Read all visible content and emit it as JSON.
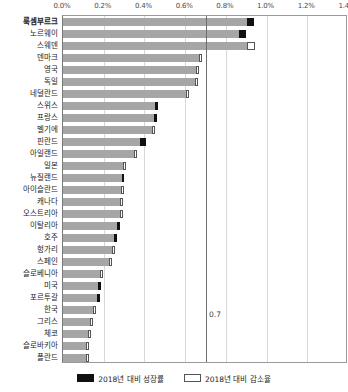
{
  "chart_data": {
    "type": "bar",
    "orientation": "horizontal",
    "title": "",
    "xlabel": "",
    "ylabel": "",
    "xlim": [
      0.0,
      1.4
    ],
    "xticks": [
      "0.0%",
      "0.2%",
      "0.4%",
      "0.6%",
      "0.8%",
      "1.0%",
      "1.2%",
      "1.4%"
    ],
    "xtick_values": [
      0.0,
      0.2,
      0.4,
      0.6,
      0.8,
      1.0,
      1.2,
      1.4
    ],
    "grid": true,
    "legend_position": "bottom",
    "annotations": [
      {
        "label": "0.7",
        "x": 0.7,
        "type": "reference-line"
      }
    ],
    "categories": [
      "룩셈부르크",
      "노르웨이",
      "스웨덴",
      "덴마크",
      "영국",
      "독일",
      "네덜란드",
      "스위스",
      "프랑스",
      "벨기에",
      "핀란드",
      "아일랜드",
      "일본",
      "뉴질랜드",
      "아이슬란드",
      "캐나다",
      "오스트리아",
      "이탈리아",
      "호주",
      "헝가리",
      "스페인",
      "슬로베니아",
      "미국",
      "포르투갈",
      "한국",
      "그리스",
      "체코",
      "슬로바키아",
      "폴란드"
    ],
    "series": [
      {
        "name": "2018년 대비 성장률",
        "color": "#111111",
        "key": "up"
      },
      {
        "name": "2018년 대비 감소율",
        "color": "#ffffff",
        "key": "down"
      }
    ],
    "base_color": "#a6a6a6",
    "values": [
      {
        "category": "룩셈부르크",
        "base": 0.905,
        "cap": 0.035,
        "cap_type": "up",
        "total": 0.94
      },
      {
        "category": "노르웨이",
        "base": 0.865,
        "cap": 0.035,
        "cap_type": "up",
        "total": 0.9
      },
      {
        "category": "스웨덴",
        "base": 0.905,
        "cap": 0.04,
        "cap_type": "down",
        "total": 0.945
      },
      {
        "category": "덴마크",
        "base": 0.675,
        "cap": 0.01,
        "cap_type": "down",
        "total": 0.685
      },
      {
        "category": "영국",
        "base": 0.66,
        "cap": 0.01,
        "cap_type": "down",
        "total": 0.67
      },
      {
        "category": "독일",
        "base": 0.655,
        "cap": 0.01,
        "cap_type": "down",
        "total": 0.665
      },
      {
        "category": "네덜란드",
        "base": 0.61,
        "cap": 0.01,
        "cap_type": "down",
        "total": 0.62
      },
      {
        "category": "스위스",
        "base": 0.455,
        "cap": 0.012,
        "cap_type": "up",
        "total": 0.467
      },
      {
        "category": "프랑스",
        "base": 0.45,
        "cap": 0.012,
        "cap_type": "up",
        "total": 0.462
      },
      {
        "category": "벨기에",
        "base": 0.44,
        "cap": 0.012,
        "cap_type": "down",
        "total": 0.452
      },
      {
        "category": "핀란드",
        "base": 0.38,
        "cap": 0.03,
        "cap_type": "up",
        "total": 0.41
      },
      {
        "category": "아일랜드",
        "base": 0.355,
        "cap": 0.01,
        "cap_type": "down",
        "total": 0.365
      },
      {
        "category": "일본",
        "base": 0.3,
        "cap": 0.01,
        "cap_type": "down",
        "total": 0.31
      },
      {
        "category": "뉴질랜드",
        "base": 0.29,
        "cap": 0.012,
        "cap_type": "up",
        "total": 0.302
      },
      {
        "category": "아이슬란드",
        "base": 0.29,
        "cap": 0.008,
        "cap_type": "down",
        "total": 0.298
      },
      {
        "category": "캐나다",
        "base": 0.285,
        "cap": 0.008,
        "cap_type": "down",
        "total": 0.293
      },
      {
        "category": "오스트리아",
        "base": 0.285,
        "cap": 0.008,
        "cap_type": "down",
        "total": 0.293
      },
      {
        "category": "이탈리아",
        "base": 0.27,
        "cap": 0.012,
        "cap_type": "up",
        "total": 0.282
      },
      {
        "category": "호주",
        "base": 0.255,
        "cap": 0.012,
        "cap_type": "up",
        "total": 0.267
      },
      {
        "category": "헝가리",
        "base": 0.245,
        "cap": 0.008,
        "cap_type": "down",
        "total": 0.253
      },
      {
        "category": "스페인",
        "base": 0.235,
        "cap": 0.008,
        "cap_type": "down",
        "total": 0.243
      },
      {
        "category": "슬로베니아",
        "base": 0.19,
        "cap": 0.008,
        "cap_type": "down",
        "total": 0.198
      },
      {
        "category": "미국",
        "base": 0.175,
        "cap": 0.012,
        "cap_type": "up",
        "total": 0.187
      },
      {
        "category": "포르투갈",
        "base": 0.17,
        "cap": 0.012,
        "cap_type": "up",
        "total": 0.182
      },
      {
        "category": "한국",
        "base": 0.15,
        "cap": 0.012,
        "cap_type": "down",
        "total": 0.162
      },
      {
        "category": "그리스",
        "base": 0.14,
        "cap": 0.008,
        "cap_type": "down",
        "total": 0.148
      },
      {
        "category": "체코",
        "base": 0.13,
        "cap": 0.008,
        "cap_type": "down",
        "total": 0.138
      },
      {
        "category": "슬로바키아",
        "base": 0.12,
        "cap": 0.008,
        "cap_type": "down",
        "total": 0.128
      },
      {
        "category": "폴란드",
        "base": 0.12,
        "cap": 0.008,
        "cap_type": "down",
        "total": 0.128
      }
    ]
  },
  "legend": {
    "items": [
      {
        "label": "2018년 대비 성장률",
        "type": "up"
      },
      {
        "label": "2018년 대비 감소율",
        "type": "down"
      }
    ]
  }
}
